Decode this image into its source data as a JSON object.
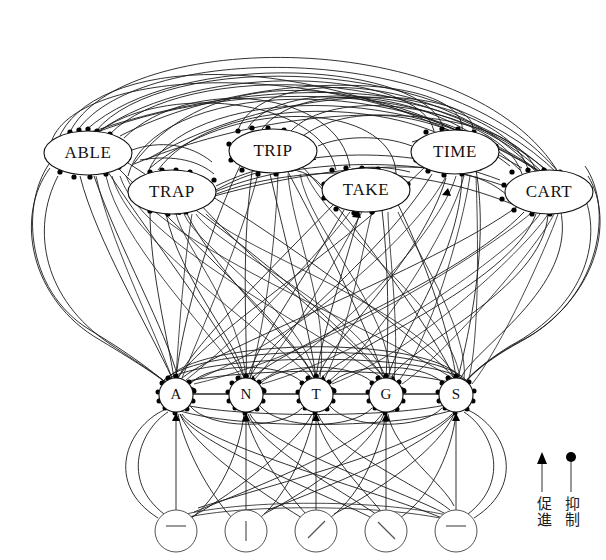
{
  "figure": {
    "background_color": "#ffffff",
    "line_color": "#1a1a1a",
    "node_fill": "#ffffff"
  },
  "layers": {
    "word_layer": {
      "name": "word-level-nodes",
      "nodes": [
        {
          "label": "ABLE",
          "cx": 88,
          "cy": 153,
          "rx": 44,
          "ry": 22
        },
        {
          "label": "TRAP",
          "cx": 172,
          "cy": 192,
          "rx": 44,
          "ry": 22
        },
        {
          "label": "TRIP",
          "cx": 273,
          "cy": 151,
          "rx": 44,
          "ry": 22
        },
        {
          "label": "TAKE",
          "cx": 366,
          "cy": 190,
          "rx": 44,
          "ry": 22
        },
        {
          "label": "TIME",
          "cx": 455,
          "cy": 152,
          "rx": 44,
          "ry": 22
        },
        {
          "label": "CART",
          "cx": 549,
          "cy": 192,
          "rx": 44,
          "ry": 22
        }
      ]
    },
    "letter_layer": {
      "name": "letter-level-nodes",
      "nodes": [
        {
          "label": "A",
          "cx": 176,
          "cy": 395,
          "r": 17
        },
        {
          "label": "N",
          "cx": 246,
          "cy": 395,
          "r": 17
        },
        {
          "label": "T",
          "cx": 316,
          "cy": 395,
          "r": 17
        },
        {
          "label": "G",
          "cx": 386,
          "cy": 395,
          "r": 17
        },
        {
          "label": "S",
          "cx": 456,
          "cy": 395,
          "r": 17
        }
      ]
    },
    "feature_layer": {
      "name": "feature-level-nodes",
      "nodes": [
        {
          "glyph": "horizontal-bar",
          "cx": 176,
          "cy": 531,
          "r": 21
        },
        {
          "glyph": "vertical-bar",
          "cx": 246,
          "cy": 531,
          "r": 21
        },
        {
          "glyph": "slash-diagonal",
          "cx": 316,
          "cy": 531,
          "r": 21
        },
        {
          "glyph": "backslash-diagonal",
          "cx": 386,
          "cy": 531,
          "r": 21
        },
        {
          "glyph": "horizontal-bar",
          "cx": 456,
          "cy": 531,
          "r": 21
        }
      ]
    }
  },
  "legend": {
    "excitatory": {
      "label": "促進",
      "marker": "arrow-up-icon"
    },
    "inhibitory": {
      "label": "抑制",
      "marker": "filled-dot-icon"
    }
  }
}
